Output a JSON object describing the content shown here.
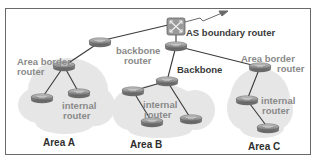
{
  "diagram": {
    "title": "",
    "colors": {
      "cloud": "#e6e6e6",
      "router_body": "#8c8c8c",
      "router_top": "#b4b4b4",
      "link": "#3a3a3a",
      "label_gray": "#8a8a8a",
      "label_dark": "#3a3a3a",
      "frame": "#6a6a6a"
    },
    "labels": {
      "as_boundary_router": "AS boundary router",
      "backbone_router_line1": "backbone",
      "backbone_router_line2": "router",
      "backbone": "Backbone",
      "area_border_router_a_line1": "Area border",
      "area_border_router_a_line2": "router",
      "area_border_router_c_line1": "Area border",
      "area_border_router_c_line2": "router",
      "internal_router_a_line1": "internal",
      "internal_router_a_line2": "router",
      "internal_router_b_line1": "internal",
      "internal_router_b_line2": "router",
      "internal_router_c_line1": "internal",
      "internal_router_c_line2": "router",
      "area_a": "Area A",
      "area_b": "Area B",
      "area_c": "Area C"
    },
    "nodes": [
      {
        "id": "asbr",
        "type": "switch",
        "x": 176,
        "y": 27
      },
      {
        "id": "bb_top",
        "type": "router",
        "x": 176,
        "y": 46
      },
      {
        "id": "bb_left",
        "type": "router",
        "x": 100,
        "y": 42
      },
      {
        "id": "abr_a",
        "type": "router",
        "x": 64,
        "y": 66
      },
      {
        "id": "a_int1",
        "type": "router",
        "x": 42,
        "y": 98
      },
      {
        "id": "a_int2",
        "type": "router",
        "x": 79,
        "y": 93
      },
      {
        "id": "abr_b",
        "type": "router",
        "x": 167,
        "y": 81
      },
      {
        "id": "b_left",
        "type": "router",
        "x": 133,
        "y": 91
      },
      {
        "id": "b_bottom",
        "type": "router",
        "x": 152,
        "y": 122
      },
      {
        "id": "b_right",
        "type": "router",
        "x": 191,
        "y": 119
      },
      {
        "id": "abr_c",
        "type": "router",
        "x": 260,
        "y": 67
      },
      {
        "id": "c_int1",
        "type": "router",
        "x": 247,
        "y": 100
      },
      {
        "id": "c_int2",
        "type": "router",
        "x": 268,
        "y": 128
      }
    ],
    "links": [
      [
        "asbr",
        "bb_top"
      ],
      [
        "asbr",
        "bb_left"
      ],
      [
        "bb_left",
        "abr_a"
      ],
      [
        "abr_a",
        "a_int1"
      ],
      [
        "abr_a",
        "a_int2"
      ],
      [
        "bb_top",
        "abr_b"
      ],
      [
        "bb_top",
        "abr_c"
      ],
      [
        "abr_b",
        "b_left"
      ],
      [
        "abr_b",
        "b_right"
      ],
      [
        "b_left",
        "b_bottom"
      ],
      [
        "abr_c",
        "c_int1"
      ],
      [
        "c_int1",
        "c_int2"
      ]
    ]
  }
}
